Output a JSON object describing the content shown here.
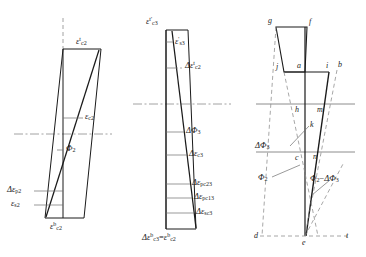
{
  "figure": {
    "panel_count": 3,
    "colors": {
      "line": "#1a1a1a",
      "thin": "#6e6e6e",
      "dash": "#8a8a8a",
      "background": "#ffffff"
    }
  },
  "panel1": {
    "name": "stage-2-strain-diagram",
    "labels": {
      "top": "ε_c2^t",
      "mid": "ε_c2",
      "curvature": "Φ_2",
      "delta_p": "Δε_p2",
      "eps_s": "ε_s2",
      "bottom": "ε_c2^b"
    },
    "parts": {
      "top_base": "ε",
      "top_sub": "c2",
      "top_sup": "t",
      "mid_base": "ε",
      "mid_sub": "c2",
      "phi_base": "Φ",
      "phi_sub": "2",
      "dp_base": "Δε",
      "dp_sub": "p2",
      "es_base": "ε",
      "es_sub": "s2",
      "bot_base": "ε",
      "bot_sub": "c2",
      "bot_sup": "b"
    }
  },
  "panel2": {
    "name": "stage-3-incremental-strain-diagram",
    "labels": {
      "top": "ε_c3^t'",
      "eps_s3": "ε_s3'",
      "delta_top": "Δε_c2^t",
      "delta_phi": "ΔΦ_3",
      "delta_c3": "Δε_c3",
      "delta_pc23": "Δε_pc23",
      "delta_pc13": "Δε_pc13",
      "delta_sc3": "Δε_sc3",
      "bottom": "Δε_c3^b = ε_c2^b"
    },
    "parts": {
      "top_base": "ε",
      "top_sub": "c3",
      "top_sup": "t'",
      "s3_base": "ε",
      "s3_sub": "s3",
      "s3_sup": "'",
      "dtop_base": "Δε",
      "dtop_sub": "c2",
      "dtop_sup": "t",
      "dphi_base": "ΔΦ",
      "dphi_sub": "3",
      "dc3_base": "Δε",
      "dc3_sub": "c3",
      "pc23_base": "Δε",
      "pc23_sub": "pc23",
      "pc13_base": "Δε",
      "pc13_sub": "pc13",
      "sc3_base": "Δε",
      "sc3_sub": "sc3",
      "bot_l_base": "Δε",
      "bot_l_sub": "c3",
      "bot_l_sup": "b",
      "bot_eq": "=",
      "bot_r_base": "ε",
      "bot_r_sub": "c2",
      "bot_r_sup": "b"
    }
  },
  "panel3": {
    "name": "combined-geometry-diagram",
    "points": [
      "g",
      "f",
      "j",
      "a",
      "i",
      "b",
      "h",
      "m",
      "k",
      "c",
      "n",
      "d",
      "e",
      "t"
    ],
    "labels": {
      "delta_phi3": "ΔΦ_3",
      "phi2": "Φ_2",
      "phi2_minus": "Φ_2−ΔΦ_3"
    },
    "parts": {
      "dphi_base": "ΔΦ",
      "dphi_sub": "3",
      "phi_base": "Φ",
      "phi_sub": "2",
      "diff_phi": "Φ",
      "diff_sub": "2",
      "diff_minus": "−",
      "diff_dphi": "ΔΦ",
      "diff_dsub": "3"
    }
  }
}
